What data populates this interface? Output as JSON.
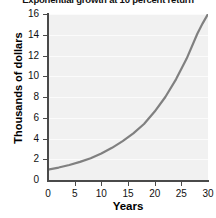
{
  "chart_data": {
    "type": "line",
    "title": "Exponential growth at 10 percent return",
    "xlabel": "Years",
    "ylabel": "Thousands of dollars",
    "xlim": [
      0,
      30
    ],
    "ylim": [
      0,
      16
    ],
    "grid": true,
    "legend": false,
    "xticks": [
      "0",
      "5",
      "10",
      "15",
      "20",
      "25",
      "30"
    ],
    "xtick_values": [
      0,
      5,
      10,
      15,
      20,
      25,
      30
    ],
    "yticks": [
      "0",
      "2",
      "4",
      "6",
      "8",
      "10",
      "12",
      "14",
      "16"
    ],
    "ytick_values": [
      0,
      2,
      4,
      6,
      8,
      10,
      12,
      14,
      16
    ],
    "series": [
      {
        "name": "Balance",
        "color": "#808080",
        "x": [
          0,
          2,
          4,
          6,
          8,
          10,
          12,
          14,
          16,
          18,
          20,
          22,
          24,
          26,
          28,
          29,
          30
        ],
        "values": [
          1.0,
          1.2,
          1.45,
          1.75,
          2.1,
          2.55,
          3.1,
          3.75,
          4.5,
          5.4,
          6.6,
          8.0,
          9.7,
          11.7,
          14.1,
          15.1,
          16.0
        ]
      }
    ]
  },
  "colors": {
    "curve": "#808080",
    "plot_background": "#f1f1f1",
    "gridline": "#fbfbfb",
    "axis": "#4a4a4a",
    "text": "#111111"
  }
}
